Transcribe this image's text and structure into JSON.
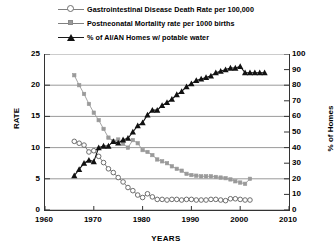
{
  "chart_data": {
    "type": "line",
    "title": "",
    "subtitle": "",
    "xlabel": "YEARS",
    "ylabel": "RATE",
    "ylabel_secondary": "% of Homes",
    "xlim": [
      1960,
      2010
    ],
    "ylim": [
      0,
      25
    ],
    "ylim_secondary": [
      0,
      100
    ],
    "xticks": [
      "1960",
      "1970",
      "1980",
      "1990",
      "2000",
      "2010"
    ],
    "yticks_left": [
      "0",
      "5",
      "10",
      "15",
      "20",
      "25"
    ],
    "yticks_right": [
      "0",
      "10",
      "20",
      "30",
      "40",
      "50",
      "60",
      "70",
      "80",
      "90",
      "100"
    ],
    "grid": true,
    "grid_axis": "y",
    "legend_position": "top-left",
    "series": [
      {
        "name": "Gastrointestinal Disease Death Rate per 100,000",
        "axis": "left",
        "marker": "open-circle",
        "color": "#6e6e6e",
        "x": [
          1966,
          1967,
          1968,
          1969,
          1970,
          1971,
          1972,
          1973,
          1974,
          1975,
          1976,
          1977,
          1978,
          1979,
          1980,
          1981,
          1982,
          1983,
          1984,
          1985,
          1986,
          1987,
          1988,
          1989,
          1990,
          1991,
          1992,
          1993,
          1994,
          1995,
          1996,
          1997,
          1998,
          1999,
          2000,
          2001,
          2002
        ],
        "y": [
          11.0,
          10.7,
          10.4,
          9.3,
          9.5,
          8.6,
          7.6,
          6.6,
          6.0,
          5.2,
          4.5,
          3.6,
          3.1,
          2.4,
          2.0,
          2.6,
          2.1,
          1.7,
          1.7,
          1.6,
          1.7,
          1.7,
          1.6,
          1.7,
          1.7,
          1.6,
          1.6,
          1.6,
          1.7,
          1.7,
          1.6,
          1.5,
          1.8,
          1.8,
          1.7,
          1.6,
          1.6
        ]
      },
      {
        "name": "Postneonatal Mortality rate per 1000 births",
        "axis": "left",
        "marker": "small-square",
        "color": "#9a9a9a",
        "x": [
          1966,
          1967,
          1968,
          1969,
          1970,
          1971,
          1972,
          1973,
          1974,
          1975,
          1976,
          1977,
          1978,
          1979,
          1980,
          1981,
          1982,
          1983,
          1984,
          1985,
          1986,
          1987,
          1988,
          1989,
          1990,
          1991,
          1992,
          1993,
          1994,
          1995,
          1996,
          1997,
          1998,
          1999,
          2000,
          2001,
          2002
        ],
        "y": [
          21.6,
          20.0,
          18.6,
          17.0,
          15.6,
          14.4,
          13.0,
          11.6,
          11.0,
          11.3,
          10.6,
          10.0,
          11.2,
          10.7,
          9.6,
          9.3,
          8.8,
          8.1,
          7.8,
          7.5,
          7.0,
          6.6,
          6.3,
          5.8,
          5.6,
          5.5,
          5.4,
          5.4,
          5.4,
          5.3,
          5.2,
          5.1,
          4.9,
          4.6,
          4.4,
          4.2,
          5.0
        ]
      },
      {
        "name": "% of AI/AN Homes w/ potable water",
        "axis": "right",
        "marker": "filled-triangle",
        "color": "#111111",
        "x": [
          1966,
          1967,
          1968,
          1969,
          1970,
          1971,
          1972,
          1973,
          1974,
          1975,
          1976,
          1977,
          1978,
          1979,
          1980,
          1981,
          1982,
          1983,
          1984,
          1985,
          1986,
          1987,
          1988,
          1989,
          1990,
          1991,
          1992,
          1993,
          1994,
          1995,
          1996,
          1997,
          1998,
          1999,
          2000,
          2001,
          2002,
          2003,
          2004,
          2005
        ],
        "y": [
          22.0,
          26.0,
          30.0,
          32.0,
          31.0,
          40.0,
          41.0,
          41.0,
          44.0,
          43.0,
          45.0,
          46.0,
          50.0,
          54.0,
          56.0,
          61.0,
          64.0,
          64.0,
          67.0,
          69.0,
          71.0,
          74.0,
          76.0,
          79.0,
          81.0,
          83.0,
          84.0,
          85.0,
          86.0,
          88.0,
          89.0,
          90.0,
          91.0,
          91.0,
          92.0,
          88.0,
          88.0,
          88.0,
          88.0,
          88.0
        ]
      }
    ]
  },
  "legend": {
    "items": [
      {
        "label": "Gastrointestinal Disease Death Rate per 100,000",
        "marker": "open-circle"
      },
      {
        "label": "Postneonatal Mortality rate per 1000 births",
        "marker": "small-square"
      },
      {
        "label": "% of AI/AN Homes w/ potable water",
        "marker": "filled-triangle"
      }
    ]
  },
  "colors": {
    "gi_series": "#6e6e6e",
    "postneonatal_series": "#9a9a9a",
    "potable_water_series": "#111111",
    "grid": "#808080",
    "axis": "#333333"
  }
}
